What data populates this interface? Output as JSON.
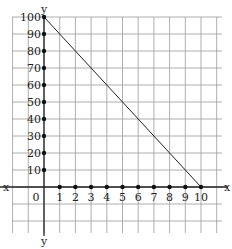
{
  "chart_data": {
    "type": "line",
    "title": "",
    "xlabel": "x",
    "ylabel": "y",
    "x_ticks": [
      1,
      2,
      3,
      4,
      5,
      6,
      7,
      8,
      9,
      10
    ],
    "y_ticks": [
      10,
      20,
      30,
      40,
      50,
      60,
      70,
      80,
      90,
      100
    ],
    "origin_label": "0",
    "xlim": [
      -2,
      11
    ],
    "ylim": [
      -30,
      110
    ],
    "grid": true,
    "series": [
      {
        "name": "line",
        "x": [
          0,
          10
        ],
        "y": [
          100,
          0
        ]
      }
    ]
  },
  "labels": {
    "y_top": "y",
    "y_bottom": "y",
    "x_left": "x",
    "x_right": "x",
    "origin": "0",
    "x_ticks": [
      "1",
      "2",
      "3",
      "4",
      "5",
      "6",
      "7",
      "8",
      "9",
      "10"
    ],
    "y_ticks": [
      "10",
      "20",
      "30",
      "40",
      "50",
      "60",
      "70",
      "80",
      "90",
      "100"
    ]
  }
}
